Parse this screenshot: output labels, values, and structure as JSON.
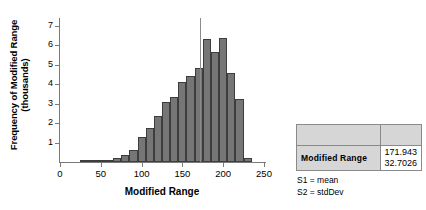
{
  "chart_data": {
    "type": "bar",
    "title": "",
    "xlabel": "Modified Range",
    "ylabel": "Frequency of Modified Range (thousands)",
    "ylabel_line1": "Frequency of Modified Range",
    "ylabel_line2": "(thousands)",
    "xlim": [
      0,
      250
    ],
    "ylim": [
      0,
      7.4
    ],
    "grid": false,
    "xticks": [
      0,
      50,
      100,
      150,
      200,
      250
    ],
    "xtick_labels": [
      "0",
      "50",
      "100",
      "150",
      "200",
      "250"
    ],
    "yticks": [
      1,
      2,
      3,
      4,
      5,
      6,
      7
    ],
    "ytick_labels": [
      "1",
      "2",
      "3",
      "4",
      "5",
      "6",
      "7"
    ],
    "bin_width": 10,
    "bins": [
      {
        "x0": 25,
        "x1": 35,
        "value": 0.02
      },
      {
        "x0": 35,
        "x1": 45,
        "value": 0.03
      },
      {
        "x0": 45,
        "x1": 55,
        "value": 0.05
      },
      {
        "x0": 55,
        "x1": 65,
        "value": 0.12
      },
      {
        "x0": 65,
        "x1": 75,
        "value": 0.22
      },
      {
        "x0": 75,
        "x1": 85,
        "value": 0.38
      },
      {
        "x0": 85,
        "x1": 95,
        "value": 0.62
      },
      {
        "x0": 95,
        "x1": 105,
        "value": 1.28
      },
      {
        "x0": 105,
        "x1": 115,
        "value": 1.75
      },
      {
        "x0": 115,
        "x1": 125,
        "value": 2.35
      },
      {
        "x0": 125,
        "x1": 135,
        "value": 3.1
      },
      {
        "x0": 135,
        "x1": 145,
        "value": 3.35
      },
      {
        "x0": 145,
        "x1": 155,
        "value": 4.1
      },
      {
        "x0": 155,
        "x1": 165,
        "value": 4.4
      },
      {
        "x0": 165,
        "x1": 175,
        "value": 4.85
      },
      {
        "x0": 175,
        "x1": 185,
        "value": 6.3
      },
      {
        "x0": 185,
        "x1": 195,
        "value": 5.65
      },
      {
        "x0": 195,
        "x1": 205,
        "value": 6.35
      },
      {
        "x0": 205,
        "x1": 215,
        "value": 4.55
      },
      {
        "x0": 215,
        "x1": 225,
        "value": 3.25
      },
      {
        "x0": 225,
        "x1": 235,
        "value": 0.22
      }
    ],
    "reference_line": {
      "name": "mean",
      "value": 171.943,
      "orientation": "vertical"
    },
    "bar_fill": "#767676",
    "bar_edge": "#3d3d3d",
    "reference_line_color": "#8c8c8c"
  },
  "stats_table": {
    "header": [
      "",
      ""
    ],
    "row_label": "Modified  Range",
    "values": [
      "171.943",
      "32.7026"
    ]
  },
  "legend": {
    "s1": "S1 = mean",
    "s2": "S2 = stdDev"
  }
}
